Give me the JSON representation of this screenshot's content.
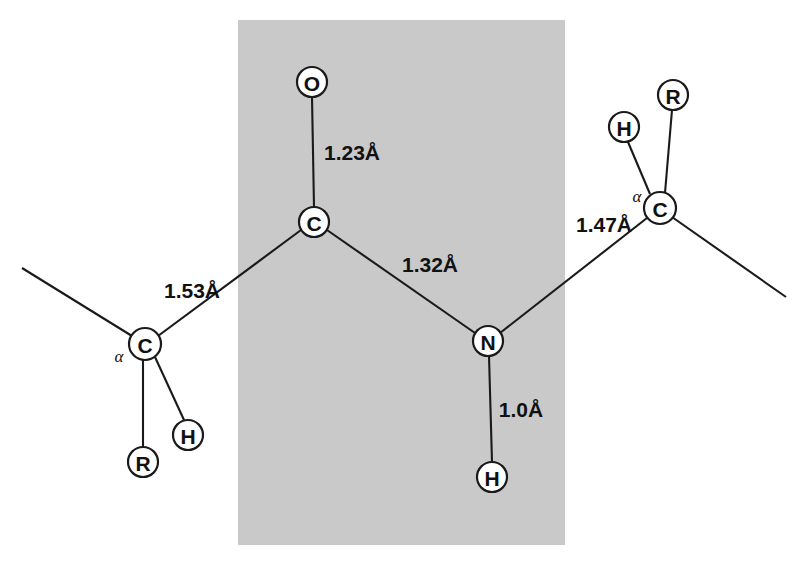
{
  "figure": {
    "background_color": "#ffffff",
    "plane_highlight": {
      "name": "peptide-plane",
      "color": "#c9c9c9",
      "x": 238,
      "y": 20,
      "width": 327,
      "height": 525
    }
  },
  "atoms": [
    {
      "id": "o-carbonyl",
      "label": "O",
      "cx": 312,
      "cy": 82,
      "r": 15
    },
    {
      "id": "c-carbonyl",
      "label": "C",
      "cx": 314,
      "cy": 222,
      "r": 15
    },
    {
      "id": "n-amide",
      "label": "N",
      "cx": 488,
      "cy": 341,
      "r": 15
    },
    {
      "id": "h-amide",
      "label": "H",
      "cx": 492,
      "cy": 477,
      "r": 15
    },
    {
      "id": "c-alpha-left",
      "label": "C",
      "cx": 145,
      "cy": 344,
      "r": 16
    },
    {
      "id": "r-left",
      "label": "R",
      "cx": 143,
      "cy": 462,
      "r": 15
    },
    {
      "id": "h-left",
      "label": "H",
      "cx": 188,
      "cy": 435,
      "r": 15
    },
    {
      "id": "c-alpha-right",
      "label": "C",
      "cx": 660,
      "cy": 208,
      "r": 16
    },
    {
      "id": "h-right",
      "label": "H",
      "cx": 624,
      "cy": 127,
      "r": 15
    },
    {
      "id": "r-right",
      "label": "R",
      "cx": 673,
      "cy": 95,
      "r": 15
    }
  ],
  "alpha_annotations": [
    {
      "id": "alpha-left",
      "label": "α",
      "x": 119,
      "y": 356
    },
    {
      "id": "alpha-right",
      "label": "α",
      "x": 637,
      "y": 196
    }
  ],
  "bond_distances": [
    {
      "id": "dist-c-o",
      "label": "1.23Å",
      "x": 352,
      "y": 152,
      "bond": "C=O"
    },
    {
      "id": "dist-c-n",
      "label": "1.32Å",
      "x": 430,
      "y": 264,
      "bond": "C-N"
    },
    {
      "id": "dist-calpha-c",
      "label": "1.53Å",
      "x": 192,
      "y": 290,
      "bond": "Cα-C"
    },
    {
      "id": "dist-n-calpha",
      "label": "1.47Å",
      "x": 604,
      "y": 224,
      "bond": "N-Cα"
    },
    {
      "id": "dist-n-h",
      "label": "1.0Å",
      "x": 521,
      "y": 409,
      "bond": "N-H"
    }
  ],
  "bonds": [
    {
      "id": "bond-o-c",
      "x1": 312,
      "y1": 97,
      "x2": 314,
      "y2": 207
    },
    {
      "id": "bond-c-n",
      "x1": 327,
      "y1": 230,
      "x2": 475,
      "y2": 333
    },
    {
      "id": "bond-c-calphaleft",
      "x1": 301,
      "y1": 230,
      "x2": 158,
      "y2": 336
    },
    {
      "id": "bond-n-h",
      "x1": 489,
      "y1": 356,
      "x2": 492,
      "y2": 462
    },
    {
      "id": "bond-n-calpharight",
      "x1": 500,
      "y1": 333,
      "x2": 647,
      "y2": 218
    },
    {
      "id": "bond-calphaleft-r",
      "x1": 143,
      "y1": 360,
      "x2": 143,
      "y2": 447
    },
    {
      "id": "bond-calphaleft-h",
      "x1": 155,
      "y1": 357,
      "x2": 184,
      "y2": 420
    },
    {
      "id": "bond-calphaleft-ext",
      "x1": 132,
      "y1": 336,
      "x2": 22,
      "y2": 268
    },
    {
      "id": "bond-calpharight-h",
      "x1": 650,
      "y1": 194,
      "x2": 628,
      "y2": 142
    },
    {
      "id": "bond-calpharight-r",
      "x1": 665,
      "y1": 193,
      "x2": 672,
      "y2": 110
    },
    {
      "id": "bond-calpharight-ext",
      "x1": 672,
      "y1": 217,
      "x2": 786,
      "y2": 297
    }
  ]
}
